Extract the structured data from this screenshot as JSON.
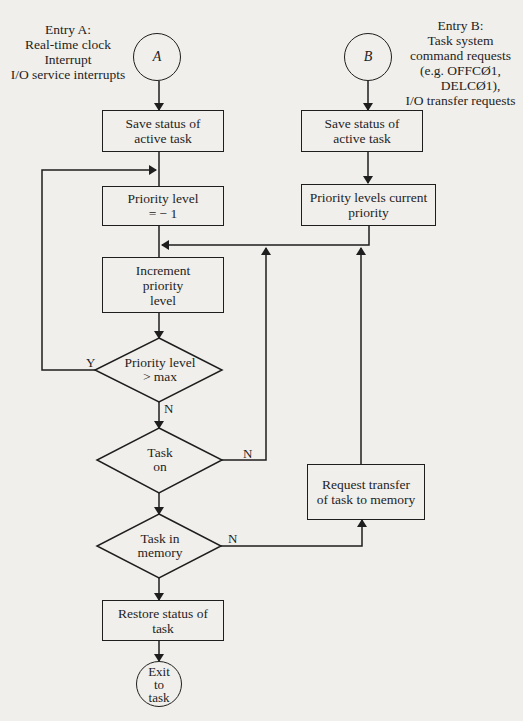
{
  "entry_a": {
    "label_lines": [
      "Entry A:",
      "Real-time clock",
      "Interrupt",
      "I/O service interrupts"
    ],
    "connector": "A"
  },
  "entry_b": {
    "label_lines": [
      "Entry B:",
      "Task system",
      "command requests",
      "(e.g. OFFCØ1,",
      "DELCØ1),",
      "I/O transfer requests"
    ],
    "connector": "B"
  },
  "nodes": {
    "save_a": "Save status of active task",
    "priority_reset": "Priority level = − 1",
    "increment": "Increment priority level",
    "priority_max": "Priority level > max",
    "task_on": "Task on",
    "task_in_memory": "Task in memory",
    "restore": "Restore status of task",
    "exit": "Exit to task",
    "save_b": "Save status of active task",
    "priority_current": "Priority levels current priority",
    "request_transfer": "Request transfer of task to memory"
  },
  "branch_labels": {
    "priority_max_yes": "Y",
    "priority_max_no": "N",
    "task_on_no": "N",
    "task_in_memory_no": "N"
  }
}
